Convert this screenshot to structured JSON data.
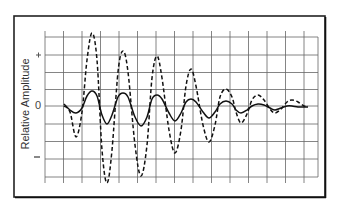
{
  "chart_data": {
    "type": "line",
    "title": "",
    "xlabel": "",
    "ylabel": "Relative Amplitude",
    "y_tick_labels": [
      "+",
      "0",
      "−"
    ],
    "x_tick_labels": [],
    "grid": true,
    "legend": null,
    "frame": {
      "left": 14,
      "top": 16,
      "right": 325,
      "bottom": 197
    },
    "grid_area": {
      "x0": 45,
      "x1": 318,
      "y_top": 35,
      "y_bottom": 179
    },
    "zero_y": 106,
    "units": "relative (peak dashed = ~1.0)",
    "series": [
      {
        "name": "dashed (large amplitude damped oscillation)",
        "style": "dashed",
        "points": [
          [
            64,
            106
          ],
          [
            70,
            112
          ],
          [
            76,
            137
          ],
          [
            82,
            112
          ],
          [
            87,
            60
          ],
          [
            92,
            33
          ],
          [
            97,
            60
          ],
          [
            102,
            150
          ],
          [
            107,
            183
          ],
          [
            112,
            150
          ],
          [
            118,
            72
          ],
          [
            123,
            51
          ],
          [
            128,
            72
          ],
          [
            135,
            145
          ],
          [
            141,
            176
          ],
          [
            147,
            145
          ],
          [
            152,
            78
          ],
          [
            157,
            56
          ],
          [
            162,
            78
          ],
          [
            169,
            130
          ],
          [
            175,
            153
          ],
          [
            181,
            130
          ],
          [
            186,
            86
          ],
          [
            191,
            69
          ],
          [
            196,
            86
          ],
          [
            203,
            125
          ],
          [
            209,
            142
          ],
          [
            215,
            125
          ],
          [
            220,
            97
          ],
          [
            226,
            89
          ],
          [
            232,
            97
          ],
          [
            236,
            112
          ],
          [
            241,
            123
          ],
          [
            247,
            114
          ],
          [
            252,
            100
          ],
          [
            258,
            95
          ],
          [
            264,
            100
          ],
          [
            270,
            109
          ],
          [
            275,
            113
          ],
          [
            281,
            109
          ],
          [
            287,
            102
          ],
          [
            292,
            100
          ],
          [
            298,
            102
          ],
          [
            304,
            106
          ],
          [
            308,
            106
          ]
        ],
        "approx_peaks_relative": [
          1.0,
          0.75,
          0.68,
          0.5,
          0.23,
          0.15,
          0.08
        ],
        "approx_troughs_relative": [
          -0.42,
          -1.05,
          -0.95,
          -0.64,
          -0.49,
          -0.23,
          -0.09
        ]
      },
      {
        "name": "solid (small amplitude oscillation)",
        "style": "solid",
        "points": [
          [
            64,
            104
          ],
          [
            70,
            110
          ],
          [
            76,
            113
          ],
          [
            82,
            108
          ],
          [
            87,
            96
          ],
          [
            92,
            91
          ],
          [
            97,
            96
          ],
          [
            102,
            115
          ],
          [
            107,
            124
          ],
          [
            112,
            115
          ],
          [
            118,
            97
          ],
          [
            123,
            93
          ],
          [
            128,
            97
          ],
          [
            135,
            117
          ],
          [
            141,
            126
          ],
          [
            147,
            117
          ],
          [
            152,
            99
          ],
          [
            157,
            95
          ],
          [
            162,
            99
          ],
          [
            169,
            113
          ],
          [
            175,
            121
          ],
          [
            181,
            113
          ],
          [
            186,
            102
          ],
          [
            191,
            99
          ],
          [
            196,
            102
          ],
          [
            203,
            112
          ],
          [
            209,
            118
          ],
          [
            215,
            112
          ],
          [
            220,
            104
          ],
          [
            226,
            101
          ],
          [
            232,
            104
          ],
          [
            236,
            110
          ],
          [
            241,
            113
          ],
          [
            247,
            110
          ],
          [
            252,
            106
          ],
          [
            258,
            104
          ],
          [
            264,
            105
          ],
          [
            270,
            108
          ],
          [
            275,
            110
          ],
          [
            281,
            108
          ],
          [
            287,
            106
          ],
          [
            292,
            106
          ],
          [
            298,
            107
          ],
          [
            304,
            107
          ],
          [
            308,
            107
          ]
        ],
        "approx_peaks_relative": [
          0.2,
          0.18,
          0.15,
          0.1,
          0.07,
          0.03
        ],
        "approx_troughs_relative": [
          -0.25,
          -0.27,
          -0.2,
          -0.16,
          -0.1,
          -0.05
        ]
      }
    ]
  },
  "axis": {
    "ylabel": "Relative Amplitude",
    "plus_label": "+",
    "zero_label": "0",
    "minus_label": "−"
  }
}
